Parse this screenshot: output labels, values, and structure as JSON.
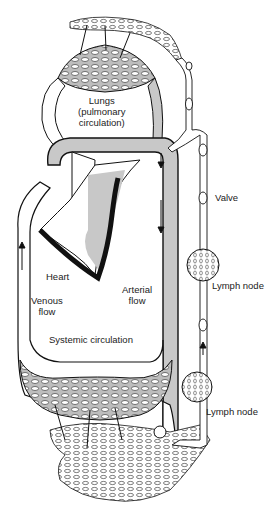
{
  "diagram": {
    "labels": {
      "lungs_line1": "Lungs",
      "lungs_line2": "(pulmonary",
      "lungs_line3": "circulation)",
      "valve": "Valve",
      "lymph_node_upper": "Lymph node",
      "heart": "Heart",
      "venous_line1": "Venous",
      "venous_line2": "flow",
      "arterial_line1": "Arterial",
      "arterial_line2": "flow",
      "systemic": "Systemic circulation",
      "lymph_node_lower": "Lymph node"
    },
    "colors": {
      "vessel_gray": "#c8c8c8",
      "outline": "#111111",
      "background": "#ffffff"
    }
  }
}
